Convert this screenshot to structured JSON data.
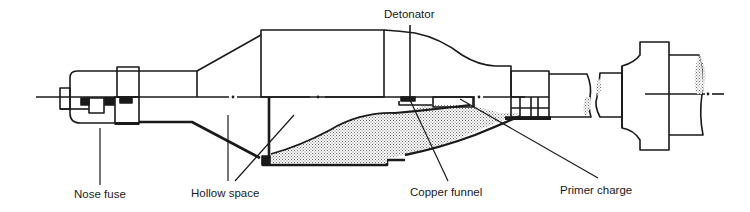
{
  "diagram": {
    "type": "technical cross-section",
    "colors": {
      "line": "#1a1a1a",
      "background": "#ffffff",
      "stipple": "#8a8a8a"
    },
    "labels": {
      "detonator": "Detonator",
      "nose_fuse": "Nose fuse",
      "hollow_space": "Hollow space",
      "copper_funnel": "Copper funnel",
      "primer_charge": "Primer charge"
    }
  }
}
